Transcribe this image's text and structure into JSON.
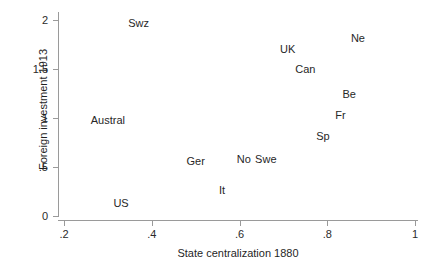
{
  "chart_data": {
    "type": "scatter",
    "title": "",
    "xlabel": "State centralization 1880",
    "ylabel": "Foreign investment 1913",
    "xlim": [
      0.14,
      1.05
    ],
    "ylim": [
      -0.08,
      2.08
    ],
    "xticks": [
      ".2",
      ".4",
      ".6",
      ".8",
      "1"
    ],
    "xtick_values": [
      0.2,
      0.4,
      0.6,
      0.8,
      1.0
    ],
    "yticks": [
      "0",
      ".5",
      "1",
      "1.5",
      "2"
    ],
    "ytick_values": [
      0,
      0.5,
      1,
      1.5,
      2
    ],
    "grid": false,
    "legend": "none",
    "marker_style": "text-label",
    "points": [
      {
        "label": "Swz",
        "x": 0.37,
        "y": 1.97
      },
      {
        "label": "Ne",
        "x": 0.87,
        "y": 1.82
      },
      {
        "label": "UK",
        "x": 0.71,
        "y": 1.7
      },
      {
        "label": "Can",
        "x": 0.75,
        "y": 1.5
      },
      {
        "label": "Be",
        "x": 0.85,
        "y": 1.24
      },
      {
        "label": "Fr",
        "x": 0.83,
        "y": 1.03
      },
      {
        "label": "Austral",
        "x": 0.3,
        "y": 0.98
      },
      {
        "label": "Sp",
        "x": 0.79,
        "y": 0.82
      },
      {
        "label": "No",
        "x": 0.61,
        "y": 0.58
      },
      {
        "label": "Swe",
        "x": 0.66,
        "y": 0.58
      },
      {
        "label": "Ger",
        "x": 0.5,
        "y": 0.56
      },
      {
        "label": "It",
        "x": 0.56,
        "y": 0.27
      },
      {
        "label": "US",
        "x": 0.33,
        "y": 0.13
      }
    ]
  }
}
